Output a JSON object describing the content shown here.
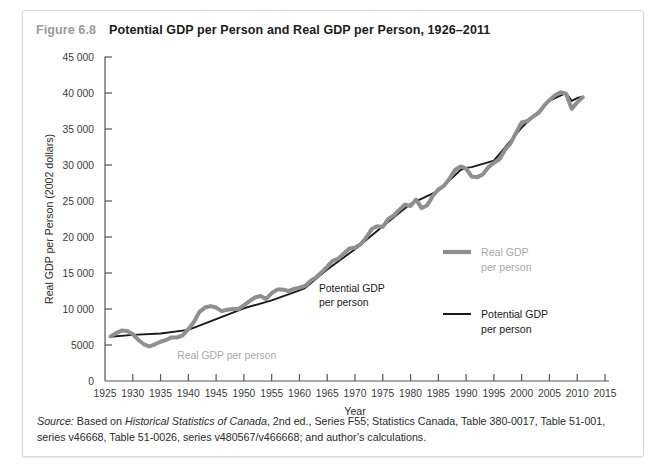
{
  "figure": {
    "number": "Figure 6.8",
    "title": "Potential GDP per Person and Real GDP per Person, 1926–2011"
  },
  "source": {
    "label": "Source:",
    "text_before_italic": " Based on ",
    "italic": "Historical Statistics of Canada",
    "text_after": ", 2nd ed., Series F55; Statistics Canada, Table 380-0017, Table 51-001, series v46668, Table 51-0026, series v480567/v466668; and author’s calculations."
  },
  "annotations": {
    "real_gdp_inchart": "Real GDP per person",
    "potential_gdp_inchart_line1": "Potential GDP",
    "potential_gdp_inchart_line2": "per person"
  },
  "legend": {
    "position": "inside-right",
    "items": [
      {
        "name": "Real GDP per person",
        "line1": "Real GDP",
        "line2": "per person",
        "color": "#8f8f8f",
        "width": 4.2
      },
      {
        "name": "Potential GDP per person",
        "line1": "Potential GDP",
        "line2": "per person",
        "color": "#1a1a1a",
        "width": 2.0
      }
    ]
  },
  "chart_data": {
    "type": "line",
    "title": "Potential GDP per Person and Real GDP per Person, 1926–2011",
    "xlabel": "Year",
    "ylabel": "Real GDP per Person (2002 dollars)",
    "xlim": [
      1925,
      2015
    ],
    "ylim": [
      0,
      45000
    ],
    "xticks": [
      1925,
      1930,
      1935,
      1940,
      1945,
      1950,
      1955,
      1960,
      1965,
      1970,
      1975,
      1980,
      1985,
      1990,
      1995,
      2000,
      2005,
      2010,
      2015
    ],
    "xtick_labels": [
      "1925",
      "1930",
      "1935",
      "1940",
      "1945",
      "1950",
      "1955",
      "1960",
      "1965",
      "1970",
      "1975",
      "1980",
      "1985",
      "1990",
      "1995",
      "2000",
      "2005",
      "2010",
      "2015"
    ],
    "yticks": [
      0,
      5000,
      10000,
      15000,
      20000,
      25000,
      30000,
      35000,
      40000,
      45000
    ],
    "ytick_labels": [
      "0",
      "5000",
      "10 000",
      "15 000",
      "20 000",
      "25 000",
      "30 000",
      "35 000",
      "40 000",
      "45 000"
    ],
    "grid": false,
    "legend": "inside right",
    "series": [
      {
        "name": "Real GDP per person",
        "color": "#8f8f8f",
        "x": [
          1926,
          1927,
          1928,
          1929,
          1930,
          1931,
          1932,
          1933,
          1934,
          1935,
          1936,
          1937,
          1938,
          1939,
          1940,
          1941,
          1942,
          1943,
          1944,
          1945,
          1946,
          1947,
          1948,
          1949,
          1950,
          1951,
          1952,
          1953,
          1954,
          1955,
          1956,
          1957,
          1958,
          1959,
          1960,
          1961,
          1962,
          1963,
          1964,
          1965,
          1966,
          1967,
          1968,
          1969,
          1970,
          1971,
          1972,
          1973,
          1974,
          1975,
          1976,
          1977,
          1978,
          1979,
          1980,
          1981,
          1982,
          1983,
          1984,
          1985,
          1986,
          1987,
          1988,
          1989,
          1990,
          1991,
          1992,
          1993,
          1994,
          1995,
          1996,
          1997,
          1998,
          1999,
          2000,
          2001,
          2002,
          2003,
          2004,
          2005,
          2006,
          2007,
          2008,
          2009,
          2010,
          2011
        ],
        "y": [
          6200,
          6650,
          7000,
          6950,
          6500,
          5700,
          5100,
          4800,
          5100,
          5450,
          5700,
          6050,
          6050,
          6350,
          7200,
          8200,
          9600,
          10200,
          10400,
          10200,
          9700,
          9900,
          10000,
          10000,
          10500,
          11100,
          11600,
          11800,
          11400,
          12200,
          12700,
          12700,
          12500,
          12800,
          12950,
          13200,
          13900,
          14400,
          15100,
          15900,
          16700,
          17000,
          17700,
          18400,
          18500,
          19000,
          19900,
          21100,
          21500,
          21400,
          22500,
          23000,
          23800,
          24500,
          24300,
          25200,
          24000,
          24400,
          25700,
          26600,
          27100,
          28100,
          29300,
          29800,
          29500,
          28400,
          28300,
          28700,
          29700,
          30300,
          30800,
          32100,
          33000,
          34500,
          35900,
          36100,
          36700,
          37200,
          38200,
          39000,
          39700,
          40100,
          39900,
          37800,
          38700,
          39400
        ]
      },
      {
        "name": "Potential GDP per person",
        "color": "#1a1a1a",
        "x": [
          1926,
          1930,
          1935,
          1940,
          1945,
          1950,
          1955,
          1960,
          1961,
          1965,
          1970,
          1975,
          1980,
          1985,
          1989,
          1990,
          1991,
          1995,
          2000,
          2005,
          2008,
          2009,
          2010,
          2011
        ],
        "y": [
          6150,
          6400,
          6600,
          7100,
          8600,
          10100,
          11200,
          12600,
          12900,
          15500,
          18300,
          21500,
          24600,
          26400,
          29300,
          29600,
          29700,
          30600,
          35200,
          38900,
          40000,
          38900,
          39300,
          39500
        ]
      }
    ],
    "annotations": [
      {
        "text": "Real GDP per person",
        "x": 1938,
        "y": 3050,
        "color": "#a8a8a8"
      },
      {
        "text": "Potential GDP",
        "x": 1963.5,
        "y": 12400,
        "color": "#1a1a1a"
      },
      {
        "text": "per person",
        "x": 1963.5,
        "y": 10400,
        "color": "#1a1a1a"
      }
    ]
  }
}
